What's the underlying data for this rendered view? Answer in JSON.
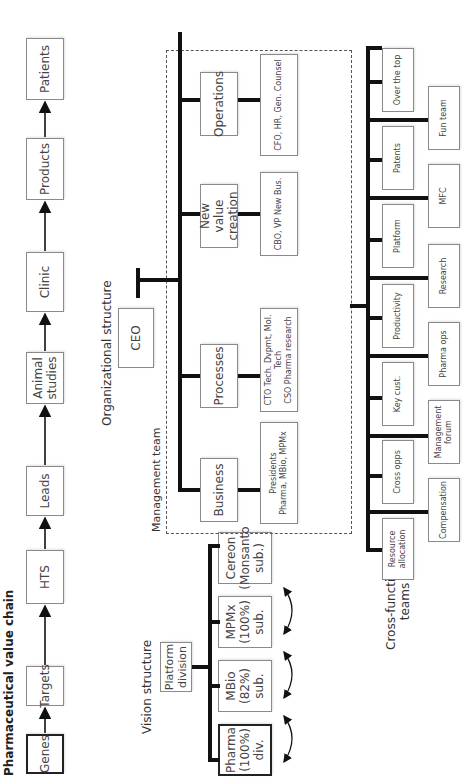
{
  "value_chain": {
    "title": "Pharmaceutical value chain",
    "steps": [
      "Genes",
      "Targets",
      "HTS",
      "Leads",
      "Animal\nstudies",
      "Clinic",
      "Products",
      "Patients"
    ]
  },
  "vision_structure": {
    "title": "Vision structure",
    "root": "Platform\ndivision",
    "units": [
      "Pharma\n(100%)\ndiv.",
      "MBio\n(82%)\nsub.",
      "MPMx\n(100%)\nsub.",
      "Cereon\n(Monsanto\nsub.)"
    ]
  },
  "org_structure": {
    "title": "Organizational structure",
    "ceo": "CEO",
    "management_team_label": "Management team",
    "functions": [
      "Business",
      "Processes",
      "New value\ncreation",
      "Operations"
    ],
    "leaders": [
      "Presidents\nPharma, MBio, MPMx",
      "CTO Tech. Dvpmt, Mol. Tech\nCSO Pharma research",
      "CBO, VP New Bus.",
      "CFO, HR, Gen. Counsel"
    ]
  },
  "cross_functional": {
    "title": "Cross-functional\nteams",
    "upper_row": [
      "Resource\nallocation",
      "Cross opps",
      "Key cust.",
      "Productivity",
      "Platform",
      "Patents",
      "Over the top"
    ],
    "lower_row": [
      "Compensation",
      "Management\nforum",
      "Pharma ops",
      "Research",
      "MFC",
      "Fun team"
    ]
  }
}
